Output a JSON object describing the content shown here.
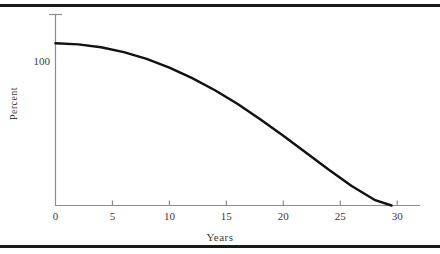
{
  "figure": {
    "background_color": "#ffffff",
    "rule_color": "#1a1a1a",
    "axis_color": "#8c8c8c",
    "curve_color": "#111111"
  },
  "chart_data": {
    "type": "line",
    "title": "",
    "subtitle": "",
    "xlabel": "Years",
    "ylabel": "Percent",
    "xlim": [
      0,
      32
    ],
    "ylim": [
      0,
      118
    ],
    "grid": false,
    "legend": null,
    "xticks": [
      0,
      5,
      10,
      15,
      20,
      25,
      30
    ],
    "xticklabels": [
      "0",
      "5",
      "10",
      "15",
      "20",
      "25",
      "30"
    ],
    "yticks": [
      100
    ],
    "yticklabels": [
      "100"
    ],
    "series": [
      {
        "name": "Percent remaining",
        "x": [
          0,
          2,
          4,
          6,
          8,
          10,
          12,
          14,
          16,
          18,
          20,
          22,
          24,
          26,
          28,
          29.5
        ],
        "values": [
          100,
          99.3,
          97.5,
          94.5,
          90.3,
          85.0,
          78.5,
          71.0,
          62.5,
          53.0,
          43.0,
          32.5,
          22.0,
          12.0,
          3.5,
          0
        ]
      }
    ],
    "annotations": []
  },
  "axis": {
    "x_title": "Years",
    "y_title": "Percent",
    "y_value_label": "100",
    "x_labels": [
      "0",
      "5",
      "10",
      "15",
      "20",
      "25",
      "30"
    ]
  }
}
